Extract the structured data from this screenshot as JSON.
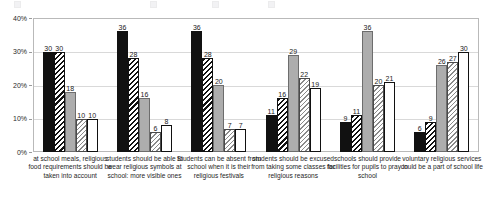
{
  "chart_data": {
    "type": "bar",
    "title": "",
    "xlabel": "",
    "ylabel": "",
    "ylim": [
      0,
      40
    ],
    "yticks": [
      "0%",
      "10%",
      "20%",
      "30%",
      "40%"
    ],
    "ytick_values": [
      0,
      10,
      20,
      30,
      40
    ],
    "grid": true,
    "legend_position": "top",
    "value_labels": true,
    "categories": [
      "at school meals, religious food requirements should be taken into account",
      "students should be able to wear religious symbols at school: more visible ones",
      "Students can be absent from school when it is their religious festivals",
      "students should be excused from taking some classes for religious reasons",
      "schools should provide facilities for pupils to pray in school",
      "voluntary religious services could be a part of school life"
    ],
    "series": [
      {
        "name": "Series 1",
        "fill": "solid-black",
        "values": [
          30,
          36,
          36,
          11,
          9,
          6
        ]
      },
      {
        "name": "Series 2",
        "fill": "black-hatch",
        "values": [
          30,
          28,
          28,
          16,
          11,
          9
        ]
      },
      {
        "name": "Series 3",
        "fill": "solid-gray",
        "values": [
          18,
          16,
          20,
          29,
          36,
          26
        ]
      },
      {
        "name": "Series 4",
        "fill": "light-hatch",
        "values": [
          10,
          6,
          7,
          22,
          20,
          27
        ]
      },
      {
        "name": "Series 5",
        "fill": "white-outline",
        "values": [
          10,
          8,
          7,
          19,
          21,
          30
        ]
      }
    ]
  },
  "legend": {
    "items": [
      "",
      "",
      "",
      ""
    ]
  }
}
